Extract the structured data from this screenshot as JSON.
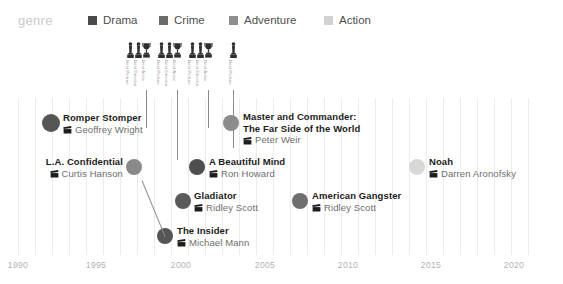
{
  "legend": {
    "title": "genre",
    "items": [
      {
        "label": "Drama",
        "color": "#4a4a4a",
        "x": 88
      },
      {
        "label": "Crime",
        "color": "#6b6b6b",
        "x": 159
      },
      {
        "label": "Adventure",
        "color": "#8e8e8e",
        "x": 229
      },
      {
        "label": "Action",
        "color": "#d2d2d2",
        "x": 324
      }
    ]
  },
  "chart_data": {
    "type": "scatter",
    "title": "",
    "xlabel": "",
    "ylabel": "",
    "xlim": [
      1989,
      2021.5
    ],
    "grid": true,
    "legend_position": "top",
    "xticks": [
      {
        "label": "1990",
        "x": 18
      },
      {
        "label": "1995",
        "x": 96
      },
      {
        "label": "2000",
        "x": 181
      },
      {
        "label": "2005",
        "x": 265
      },
      {
        "label": "2010",
        "x": 348
      },
      {
        "label": "2015",
        "x": 431
      },
      {
        "label": "2020",
        "x": 514
      }
    ],
    "gridline_x": [
      18,
      35,
      52,
      69,
      86,
      103,
      120,
      137,
      154,
      171,
      188,
      205,
      222,
      239,
      256,
      273,
      290,
      307,
      324,
      341,
      358,
      375,
      392,
      409,
      426,
      443,
      460,
      477,
      494,
      511,
      528
    ],
    "oscar_markers": [
      {
        "label": "Best Picture",
        "icon": "oscar-statuette",
        "x": 126,
        "stem_height": 0
      },
      {
        "label": "Best Director",
        "icon": "oscar-statuette",
        "x": 134,
        "stem_height": 0
      },
      {
        "label": "Best Actor",
        "icon": "oscar-trophy",
        "x": 142,
        "stem_height": 38
      },
      {
        "label": "Best Picture",
        "icon": "oscar-statuette",
        "x": 157,
        "stem_height": 0
      },
      {
        "label": "Best Director",
        "icon": "oscar-statuette",
        "x": 165,
        "stem_height": 0
      },
      {
        "label": "Best Actor",
        "icon": "oscar-trophy",
        "x": 173,
        "stem_height": 70
      },
      {
        "label": "Best Picture",
        "icon": "oscar-statuette",
        "x": 188,
        "stem_height": 0
      },
      {
        "label": "Best Director",
        "icon": "oscar-statuette",
        "x": 196,
        "stem_height": 0
      },
      {
        "label": "Best Actor",
        "icon": "oscar-trophy",
        "x": 204,
        "stem_height": 38
      },
      {
        "label": "Best Picture",
        "icon": "oscar-statuette",
        "x": 229,
        "stem_height": 58
      }
    ],
    "points": [
      {
        "title": "Romper Stomper",
        "title2": "",
        "director": "Geoffrey Wright",
        "genre": "Drama",
        "color": "#555555",
        "cx": 51,
        "cy": 83,
        "r": 9,
        "side": "right",
        "label_x": 63,
        "label_y": 72,
        "leader": null
      },
      {
        "title": "L.A. Confidential",
        "title2": "",
        "director": "Curtis Hanson",
        "genre": "Crime",
        "color": "#8a8a8a",
        "cx": 134,
        "cy": 127,
        "r": 8,
        "side": "left",
        "label_x": 123,
        "label_y": 116,
        "leader": null
      },
      {
        "title": "The Insider",
        "title2": "",
        "director": "Michael Mann",
        "genre": "Drama",
        "color": "#555555",
        "cx": 165,
        "cy": 196,
        "r": 8,
        "side": "right",
        "label_x": 177,
        "label_y": 185,
        "leader": null
      },
      {
        "title": "Gladiator",
        "title2": "",
        "director": "Adventure",
        "genre": "Adventure",
        "color": "#5a5a5a",
        "cx": 183,
        "cy": 161,
        "r": 8,
        "side": "right",
        "label_x": 194,
        "label_y": 150,
        "leader": null
      },
      {
        "title": "A Beautiful Mind",
        "title2": "",
        "director": "Ron Howard",
        "genre": "Drama",
        "color": "#4e4e4e",
        "cx": 197,
        "cy": 127,
        "r": 8,
        "side": "right",
        "label_x": 209,
        "label_y": 116,
        "leader": null
      },
      {
        "title": "Master and Commander:",
        "title2": "The Far Side of the World",
        "director": "Peter Weir",
        "genre": "Adventure",
        "color": "#8c8c8c",
        "cx": 231,
        "cy": 83,
        "r": 8,
        "side": "right",
        "label_x": 243,
        "label_y": 71,
        "leader": null
      },
      {
        "title": "American Gangster",
        "title2": "",
        "director": "Ridley Scott",
        "genre": "Crime",
        "color": "#6f6f6f",
        "cx": 300,
        "cy": 161,
        "r": 8,
        "side": "right",
        "label_x": 312,
        "label_y": 150,
        "leader": null
      },
      {
        "title": "Noah",
        "title2": "",
        "director": "Darren Aronofsky",
        "genre": "Action",
        "color": "#d8d8d8",
        "cx": 417,
        "cy": 127,
        "r": 8,
        "side": "right",
        "label_x": 429,
        "label_y": 116,
        "leader": null
      }
    ],
    "gladiator_director": "Ridley Scott"
  }
}
